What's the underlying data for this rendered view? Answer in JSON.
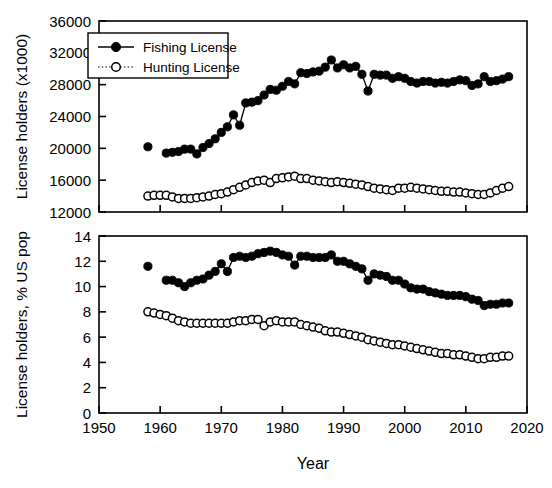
{
  "figure": {
    "background": "#ffffff",
    "foreground": "#000000",
    "xlabel": "Year",
    "panels": [
      {
        "id": "top",
        "ylabel": "License holders (x1000)",
        "ylim": [
          12000,
          36000
        ],
        "yticks": [
          "12000",
          "16000",
          "20000",
          "24000",
          "28000",
          "32000",
          "36000"
        ],
        "xlim": [
          1950,
          2020
        ],
        "xticks": [
          "",
          "",
          "",
          "",
          "",
          "",
          "",
          ""
        ],
        "legend": {
          "items": [
            {
              "label": "Fishing License",
              "marker": "filled-circle",
              "line": "solid",
              "color": "#000000"
            },
            {
              "label": "Hunting License",
              "marker": "open-circle",
              "line": "dotted",
              "color": "#000000"
            }
          ]
        }
      },
      {
        "id": "bottom",
        "ylabel": "License holders, % US pop",
        "ylim": [
          0,
          14
        ],
        "yticks": [
          "0",
          "2",
          "4",
          "6",
          "8",
          "10",
          "12",
          "14"
        ],
        "xlim": [
          1950,
          2020
        ],
        "xticks": [
          "1950",
          "1960",
          "1970",
          "1980",
          "1990",
          "2000",
          "2010",
          "2020"
        ]
      }
    ]
  },
  "chart_data": [
    {
      "type": "line",
      "panel": "top",
      "title": "",
      "xlabel": "",
      "ylabel": "License holders (x1000)",
      "xlim": [
        1950,
        2020
      ],
      "ylim": [
        12000,
        36000
      ],
      "grid": false,
      "legend_position": "upper-left",
      "series": [
        {
          "name": "Fishing License",
          "marker": "filled-circle",
          "linestyle": "solid",
          "color": "#000000",
          "x": [
            1958,
            1961,
            1962,
            1963,
            1964,
            1965,
            1966,
            1967,
            1968,
            1969,
            1970,
            1971,
            1972,
            1973,
            1974,
            1975,
            1976,
            1977,
            1978,
            1979,
            1980,
            1981,
            1982,
            1983,
            1984,
            1985,
            1986,
            1987,
            1988,
            1989,
            1990,
            1991,
            1992,
            1993,
            1994,
            1995,
            1996,
            1997,
            1998,
            1999,
            2000,
            2001,
            2002,
            2003,
            2004,
            2005,
            2006,
            2007,
            2008,
            2009,
            2010,
            2011,
            2012,
            2013,
            2014,
            2015,
            2016,
            2017
          ],
          "y": [
            20200,
            19400,
            19500,
            19600,
            19900,
            19900,
            19300,
            20100,
            20600,
            21200,
            22000,
            22700,
            24200,
            22900,
            25700,
            25800,
            26000,
            26700,
            27400,
            27300,
            27800,
            28400,
            28100,
            29500,
            29400,
            29600,
            29700,
            30200,
            31100,
            30100,
            30500,
            30100,
            30300,
            29300,
            27200,
            29300,
            29200,
            29200,
            28800,
            29000,
            28800,
            28400,
            28200,
            28400,
            28400,
            28200,
            28300,
            28200,
            28400,
            28600,
            28500,
            27900,
            28100,
            29000,
            28400,
            28500,
            28700,
            29000
          ]
        },
        {
          "name": "Hunting License",
          "marker": "open-circle",
          "linestyle": "dotted",
          "color": "#000000",
          "x": [
            1958,
            1959,
            1960,
            1961,
            1962,
            1963,
            1964,
            1965,
            1966,
            1967,
            1968,
            1969,
            1970,
            1971,
            1972,
            1973,
            1974,
            1975,
            1976,
            1977,
            1978,
            1979,
            1980,
            1981,
            1982,
            1983,
            1984,
            1985,
            1986,
            1987,
            1988,
            1989,
            1990,
            1991,
            1992,
            1993,
            1994,
            1995,
            1996,
            1997,
            1998,
            1999,
            2000,
            2001,
            2002,
            2003,
            2004,
            2005,
            2006,
            2007,
            2008,
            2009,
            2010,
            2011,
            2012,
            2013,
            2014,
            2015,
            2016,
            2017
          ],
          "y": [
            14000,
            14100,
            14100,
            14100,
            13900,
            13700,
            13700,
            13700,
            13800,
            13900,
            14000,
            14200,
            14300,
            14500,
            14800,
            15100,
            15400,
            15700,
            15900,
            16000,
            15700,
            16200,
            16300,
            16400,
            16500,
            16200,
            16200,
            16000,
            15900,
            15800,
            15700,
            15800,
            15700,
            15600,
            15500,
            15400,
            15200,
            15000,
            14900,
            14800,
            14700,
            15000,
            15000,
            15100,
            15000,
            14900,
            14800,
            14700,
            14600,
            14600,
            14500,
            14500,
            14400,
            14300,
            14200,
            14200,
            14400,
            14700,
            15000,
            15200
          ]
        }
      ]
    },
    {
      "type": "line",
      "panel": "bottom",
      "title": "",
      "xlabel": "Year",
      "ylabel": "License holders, % US pop",
      "xlim": [
        1950,
        2020
      ],
      "ylim": [
        0,
        14
      ],
      "grid": false,
      "legend_position": "none",
      "series": [
        {
          "name": "Fishing License",
          "marker": "filled-circle",
          "linestyle": "solid",
          "color": "#000000",
          "x": [
            1958,
            1961,
            1962,
            1963,
            1964,
            1965,
            1966,
            1967,
            1968,
            1969,
            1970,
            1971,
            1972,
            1973,
            1974,
            1975,
            1976,
            1977,
            1978,
            1979,
            1980,
            1981,
            1982,
            1983,
            1984,
            1985,
            1986,
            1987,
            1988,
            1989,
            1990,
            1991,
            1992,
            1993,
            1994,
            1995,
            1996,
            1997,
            1998,
            1999,
            2000,
            2001,
            2002,
            2003,
            2004,
            2005,
            2006,
            2007,
            2008,
            2009,
            2010,
            2011,
            2012,
            2013,
            2014,
            2015,
            2016,
            2017
          ],
          "y": [
            11.6,
            10.5,
            10.5,
            10.3,
            10.0,
            10.3,
            10.5,
            10.6,
            10.9,
            11.2,
            11.8,
            11.2,
            12.3,
            12.4,
            12.3,
            12.4,
            12.6,
            12.7,
            12.8,
            12.7,
            12.5,
            12.4,
            11.7,
            12.4,
            12.4,
            12.3,
            12.3,
            12.3,
            12.5,
            12.0,
            12.0,
            11.8,
            11.6,
            11.4,
            10.5,
            11.0,
            10.9,
            10.8,
            10.5,
            10.5,
            10.2,
            9.9,
            9.8,
            9.8,
            9.6,
            9.5,
            9.4,
            9.3,
            9.3,
            9.3,
            9.2,
            9.0,
            8.9,
            8.5,
            8.6,
            8.6,
            8.7,
            8.7
          ]
        },
        {
          "name": "Hunting License",
          "marker": "open-circle",
          "linestyle": "dotted",
          "color": "#000000",
          "x": [
            1958,
            1959,
            1960,
            1961,
            1962,
            1963,
            1964,
            1965,
            1966,
            1967,
            1968,
            1969,
            1970,
            1971,
            1972,
            1973,
            1974,
            1975,
            1976,
            1977,
            1978,
            1979,
            1980,
            1981,
            1982,
            1983,
            1984,
            1985,
            1986,
            1987,
            1988,
            1989,
            1990,
            1991,
            1992,
            1993,
            1994,
            1995,
            1996,
            1997,
            1998,
            1999,
            2000,
            2001,
            2002,
            2003,
            2004,
            2005,
            2006,
            2007,
            2008,
            2009,
            2010,
            2011,
            2012,
            2013,
            2014,
            2015,
            2016,
            2017
          ],
          "y": [
            8.0,
            7.9,
            7.8,
            7.7,
            7.5,
            7.3,
            7.2,
            7.1,
            7.1,
            7.1,
            7.1,
            7.1,
            7.1,
            7.1,
            7.2,
            7.3,
            7.3,
            7.4,
            7.4,
            6.9,
            7.2,
            7.3,
            7.2,
            7.2,
            7.2,
            7.0,
            6.9,
            6.8,
            6.7,
            6.5,
            6.4,
            6.4,
            6.3,
            6.2,
            6.1,
            6.0,
            5.8,
            5.7,
            5.6,
            5.5,
            5.4,
            5.4,
            5.3,
            5.2,
            5.1,
            5.0,
            4.9,
            4.8,
            4.7,
            4.7,
            4.6,
            4.6,
            4.5,
            4.4,
            4.3,
            4.3,
            4.4,
            4.4,
            4.5,
            4.5
          ]
        }
      ]
    }
  ]
}
